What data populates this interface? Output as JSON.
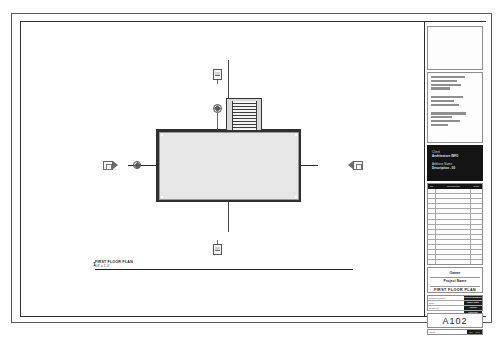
{
  "sheet": {
    "name": "architectural-drawing-sheet",
    "background_color": "#ffffff",
    "border_color": "#2e2e2e"
  },
  "drawing": {
    "view_title": "FIRST FLOOR PLAN",
    "view_number": "1",
    "view_scale": "1/4\" = 1'-0\"",
    "building_fill_color": "#e6e6e6",
    "wall_color": "#2f2f2f",
    "gridline_color": "#2a2a2a",
    "elements": {
      "stair": "stair-run",
      "section_marker_top": "section-marker",
      "section_marker_bottom": "section-marker",
      "elevation_marker_left": "elevation-marker",
      "elevation_marker_right": "elevation-marker",
      "grid_bubble_left": "grid-bubble"
    }
  },
  "title_block": {
    "logo_placeholder": "",
    "consultant_info_lines": 9,
    "project_info": {
      "label_client": "Client",
      "value_client": "Architecture INFO",
      "label_address": "Address Name",
      "value_address": "Description - 00"
    },
    "revision_table": {
      "headers": [
        "No.",
        "Description",
        "Date"
      ],
      "rows": 17
    },
    "owner_block": {
      "owner": "Owner",
      "project_name": "Project Name",
      "sheet_title": "FIRST FLOOR PLAN"
    },
    "meta_rows": [
      {
        "label": "Project number",
        "value": "Project Number"
      },
      {
        "label": "Date",
        "value": "Issue Date"
      },
      {
        "label": "Drawn by",
        "value": "Author"
      },
      {
        "label": "Checked by",
        "value": "Checker"
      }
    ],
    "sheet_number": "A102",
    "footer": {
      "label": "Scale",
      "value": "1/4\" = 1'-0\""
    }
  }
}
